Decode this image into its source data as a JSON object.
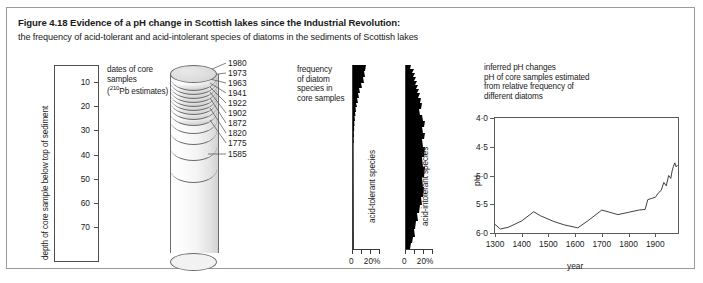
{
  "figure": {
    "title_bold": "Figure 4.18  Evidence of a pH change in Scottish lakes since the Industrial Revolution:",
    "subtitle": "the frequency of acid-tolerant and acid-intolerant species of diatoms in the sediments of Scottish lakes"
  },
  "depth_axis": {
    "outer_label": "depth of core sample below top of sediment",
    "unit_label": "centimetres",
    "ticks": [
      10,
      20,
      30,
      40,
      50,
      60,
      70
    ]
  },
  "core": {
    "caption": "dates of core\nsamples\n(",
    "caption_sup": "210",
    "caption_tail": "Pb estimates)",
    "dates": [
      1980,
      1973,
      1963,
      1941,
      1922,
      1902,
      1872,
      1820,
      1775,
      1585
    ]
  },
  "frequency": {
    "caption": "frequency\nof diatom\nspecies in\ncore samples",
    "tolerant_label": "acid-tolerant species",
    "intolerant_label": "acid-intolerant species",
    "scale_min": "0",
    "scale_max": "20%"
  },
  "ph_panel": {
    "caption": "inferred pH changes\npH of core samples estimated\nfrom relative frequency of\ndifferent diatoms",
    "y_axis_label": "pH",
    "x_axis_label": "year"
  },
  "chart_data": [
    {
      "type": "line",
      "title": "inferred pH changes",
      "xlabel": "year",
      "ylabel": "pH",
      "xlim": [
        1300,
        1985
      ],
      "ylim": [
        6.0,
        4.0
      ],
      "y_inverted": true,
      "grid": false,
      "yticks": [
        4.0,
        4.5,
        5.0,
        5.5,
        6.0
      ],
      "ytick_labels": [
        "4·0",
        "4·5",
        "5·0",
        "5·5",
        "6·0"
      ],
      "xticks": [
        1300,
        1400,
        1500,
        1600,
        1700,
        1800,
        1900
      ],
      "x": [
        1300,
        1320,
        1350,
        1400,
        1445,
        1470,
        1520,
        1560,
        1610,
        1650,
        1700,
        1730,
        1760,
        1800,
        1840,
        1862,
        1872,
        1885,
        1900,
        1912,
        1922,
        1932,
        1941,
        1950,
        1958,
        1963,
        1968,
        1973,
        1978,
        1983
      ],
      "y": [
        5.85,
        5.93,
        5.9,
        5.79,
        5.63,
        5.7,
        5.8,
        5.86,
        5.91,
        5.78,
        5.6,
        5.64,
        5.68,
        5.64,
        5.6,
        5.59,
        5.42,
        5.4,
        5.38,
        5.3,
        5.26,
        5.12,
        5.18,
        5.0,
        5.05,
        4.92,
        4.84,
        4.78,
        4.85,
        4.82
      ]
    },
    {
      "type": "area",
      "title": "acid-tolerant species",
      "xlabel": "frequency (%)",
      "ylabel": "depth (cm)",
      "xlim": [
        0,
        28
      ],
      "ylim": [
        0,
        78
      ],
      "x": [
        11,
        10,
        9.5,
        8.5,
        9,
        6.5,
        7.5,
        4.5,
        5.5,
        3.5,
        4.5,
        2.5,
        3,
        1.5,
        2.5,
        1.2,
        2,
        0.8,
        1.2,
        0.5,
        0.8,
        0.4,
        0.5,
        0.3,
        0.4,
        0.3,
        0.3,
        0.3,
        0.3,
        0.3,
        0.3,
        0.3
      ],
      "y": [
        0,
        2.5,
        5,
        7.5,
        10,
        12.5,
        15,
        17.5,
        20,
        22.5,
        25,
        27.5,
        30,
        32.5,
        35,
        37.5,
        40,
        42.5,
        45,
        47.5,
        50,
        52.5,
        55,
        57.5,
        60,
        62.5,
        65,
        67.5,
        70,
        72.5,
        75,
        78
      ]
    },
    {
      "type": "area",
      "title": "acid-intolerant species",
      "xlabel": "frequency (%)",
      "ylabel": "depth (cm)",
      "xlim": [
        0,
        28
      ],
      "ylim": [
        0,
        78
      ],
      "x": [
        4,
        6.5,
        5,
        7.5,
        6,
        8.5,
        7,
        9.5,
        8.5,
        10.5,
        9.5,
        11,
        12.5,
        14,
        13,
        12,
        11.5,
        13,
        15,
        16.5,
        15.5,
        14.5,
        15,
        16,
        15.5,
        14.5,
        13.5,
        12.5,
        11,
        9,
        7,
        5.5
      ],
      "y": [
        0,
        2.5,
        5,
        7.5,
        10,
        12.5,
        15,
        17.5,
        20,
        22.5,
        25,
        27.5,
        30,
        32.5,
        35,
        37.5,
        40,
        42.5,
        45,
        47.5,
        50,
        52.5,
        55,
        57.5,
        60,
        62.5,
        65,
        67.5,
        70,
        72.5,
        75,
        78
      ]
    }
  ]
}
